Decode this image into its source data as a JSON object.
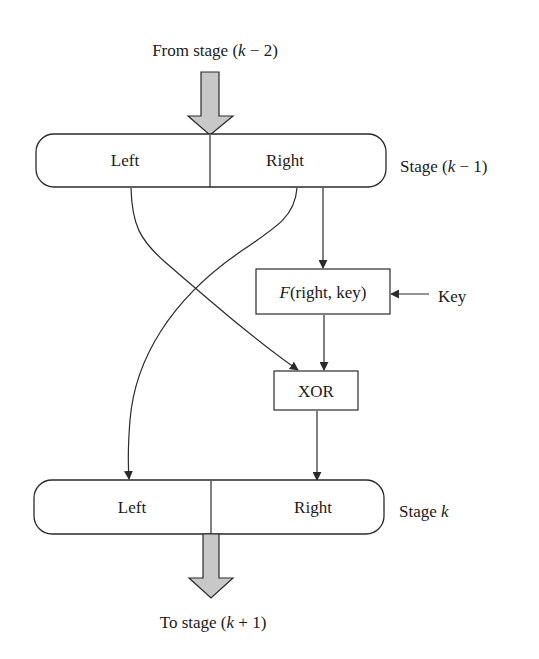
{
  "diagram": {
    "type": "feistel-round-flowchart",
    "input_label": {
      "prefix": "From stage (",
      "var": "k",
      "suffix": " − 2)"
    },
    "output_label": {
      "prefix": "To stage (",
      "var": "k",
      "suffix": " + 1)"
    },
    "stage_prev": {
      "label": {
        "prefix": "Stage (",
        "var": "k",
        "suffix": " − 1)"
      },
      "left": "Left",
      "right": "Right"
    },
    "stage_next": {
      "label": {
        "prefix": "Stage ",
        "var": "k",
        "suffix": ""
      },
      "left": "Left",
      "right": "Right"
    },
    "function_box": {
      "fn": "F",
      "args": "(right, key)"
    },
    "key_label": "Key",
    "xor_box": "XOR",
    "edges": [
      {
        "from": "stage_prev.right",
        "to": "function_box",
        "style": "straight-arrow"
      },
      {
        "from": "key_label",
        "to": "function_box",
        "style": "straight-arrow"
      },
      {
        "from": "function_box",
        "to": "xor_box",
        "style": "straight-arrow"
      },
      {
        "from": "stage_prev.left",
        "to": "xor_box",
        "style": "curved-arrow"
      },
      {
        "from": "stage_prev.right",
        "to": "stage_next.left",
        "style": "curved-arrow"
      },
      {
        "from": "xor_box",
        "to": "stage_next.right",
        "style": "straight-arrow"
      },
      {
        "from": "input",
        "to": "stage_prev",
        "style": "block-arrow"
      },
      {
        "from": "stage_next",
        "to": "output",
        "style": "block-arrow"
      }
    ],
    "colors": {
      "stroke": "#2a2a2a",
      "block_arrow_fill": "#c8c8c8",
      "background": "#ffffff"
    }
  }
}
